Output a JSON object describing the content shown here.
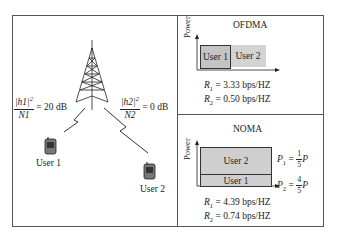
{
  "left_panel": {
    "user1_channel": {
      "numerator": "|h1|",
      "exp": "2",
      "denominator": "N1",
      "value": "= 20 dB"
    },
    "user2_channel": {
      "numerator": "|h2|",
      "exp": "2",
      "denominator": "N2",
      "value": "= 0 dB"
    },
    "user1_label": "User 1",
    "user2_label": "User 2"
  },
  "ofdma": {
    "title": "OFDMA",
    "y_axis": "Power",
    "block1": "User 1",
    "block2": "User 2",
    "r1": {
      "sym": "R",
      "sub": "1",
      "value": " = 3.33 bps/HZ"
    },
    "r2": {
      "sym": "R",
      "sub": "2",
      "value": " = 0.50 bps/HZ"
    }
  },
  "noma": {
    "title": "NOMA",
    "y_axis": "Power",
    "block_top": "User 2",
    "block_bottom": "User 1",
    "p1": {
      "sym": "P",
      "sub": "1",
      "eq": " = ",
      "num": "1",
      "den": "5",
      "tail": "P"
    },
    "p2": {
      "sym": "P",
      "sub": "2",
      "eq": " = ",
      "num": "4",
      "den": "5",
      "tail": "P"
    },
    "r1": {
      "sym": "R",
      "sub": "1",
      "value": " = 4.39 bps/HZ"
    },
    "r2": {
      "sym": "R",
      "sub": "2",
      "value": " = 0.74 bps/HZ"
    }
  },
  "colors": {
    "block_fill": "#cfcfcf",
    "border": "#555555"
  }
}
